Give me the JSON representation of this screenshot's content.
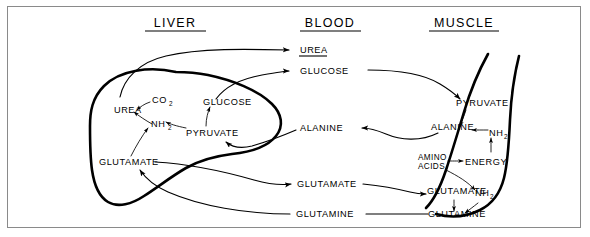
{
  "diagram": {
    "columns": [
      {
        "id": "liver",
        "label": "LIVER"
      },
      {
        "id": "blood",
        "label": "BLOOD"
      },
      {
        "id": "muscle",
        "label": "MUSCLE"
      }
    ],
    "liver_nodes": [
      {
        "id": "liver-urea",
        "label": "UREA"
      },
      {
        "id": "liver-co2",
        "label": "CO",
        "sub": "2"
      },
      {
        "id": "liver-nh2",
        "label": "NH",
        "sub": "2"
      },
      {
        "id": "liver-glucose",
        "label": "GLUCOSE"
      },
      {
        "id": "liver-pyruvate",
        "label": "PYRUVATE"
      },
      {
        "id": "liver-glutamate",
        "label": "GLUTAMATE"
      }
    ],
    "blood_nodes": [
      {
        "id": "blood-urea",
        "label": "UREA"
      },
      {
        "id": "blood-glucose",
        "label": "GLUCOSE"
      },
      {
        "id": "blood-alanine",
        "label": "ALANINE"
      },
      {
        "id": "blood-glutamate",
        "label": "GLUTAMATE"
      },
      {
        "id": "blood-glutamine",
        "label": "GLUTAMINE"
      }
    ],
    "muscle_nodes": [
      {
        "id": "muscle-pyruvate",
        "label": "PYRUVATE"
      },
      {
        "id": "muscle-alanine",
        "label": "ALANINE"
      },
      {
        "id": "muscle-nh2-upper",
        "label": "NH",
        "sub": "2"
      },
      {
        "id": "muscle-amino",
        "label": "AMINO"
      },
      {
        "id": "muscle-acids",
        "label": "ACIDS"
      },
      {
        "id": "muscle-energy",
        "label": "ENERGY"
      },
      {
        "id": "muscle-glutamate",
        "label": "GLUTAMATE"
      },
      {
        "id": "muscle-nh2-lower",
        "label": "NH",
        "sub": "2"
      },
      {
        "id": "muscle-glutamine",
        "label": "GLUTAMINE"
      }
    ],
    "colors": {
      "ink": "#000000",
      "frame": "#8a8a8a",
      "background": "#ffffff"
    }
  }
}
